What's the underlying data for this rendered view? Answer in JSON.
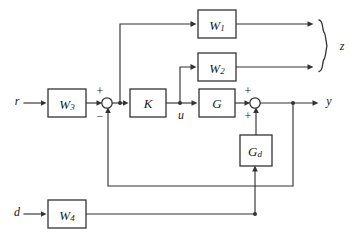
{
  "diagram": {
    "background_color": "#ffffff",
    "line_color": "#333333",
    "text_color": "#1a1a1a"
  },
  "blocks": {
    "w1": {
      "label": "W",
      "subscript": "1",
      "x": 198,
      "y": 10,
      "w": 38,
      "h": 28
    },
    "w2": {
      "label": "W",
      "subscript": "2",
      "x": 198,
      "y": 53,
      "w": 38,
      "h": 28
    },
    "w3": {
      "label": "W",
      "subscript": "3",
      "x": 48,
      "y": 89,
      "w": 38,
      "h": 28
    },
    "w4": {
      "label": "W",
      "subscript": "4",
      "x": 48,
      "y": 200,
      "w": 38,
      "h": 28
    },
    "k": {
      "label": "K",
      "subscript": "",
      "x": 130,
      "y": 89,
      "w": 36,
      "h": 28
    },
    "g": {
      "label": "G",
      "subscript": "",
      "x": 199,
      "y": 89,
      "w": 36,
      "h": 28
    },
    "gd": {
      "label": "G",
      "subscript": "d",
      "x": 240,
      "y": 135,
      "w": 32,
      "h": 31
    }
  },
  "signals": {
    "r": {
      "label": "r",
      "x": 17,
      "y": 101
    },
    "d": {
      "label": "d",
      "x": 17,
      "y": 212
    },
    "u": {
      "label": "u",
      "x": 181,
      "y": 115
    },
    "y": {
      "label": "y",
      "x": 327,
      "y": 101
    },
    "z": {
      "label": "z",
      "x": 341,
      "y": 46
    }
  },
  "summing_junctions": {
    "error_sum": {
      "name": "error-summing-junction",
      "cx": 107,
      "cy": 103,
      "r": 5.2,
      "signs": [
        {
          "symbol": "+",
          "x": 100,
          "y": 91,
          "port": "top-left-reference"
        },
        {
          "symbol": "−",
          "x": 100,
          "y": 116,
          "port": "bottom-feedback"
        }
      ]
    },
    "output_sum": {
      "name": "output-summing-junction",
      "cx": 255,
      "cy": 103,
      "r": 5.2,
      "signs": [
        {
          "symbol": "+",
          "x": 248,
          "y": 91,
          "port": "top-plant-output"
        },
        {
          "symbol": "+",
          "x": 248,
          "y": 116,
          "port": "bottom-disturbance"
        }
      ]
    }
  },
  "brace": {
    "name": "output-grouping-brace",
    "x": 318,
    "top_y": 24,
    "bottom_y": 67,
    "mid_y": 46,
    "depth": 7
  },
  "junction_dots": [
    {
      "name": "error-branch-dot",
      "cx": 120,
      "cy": 103
    },
    {
      "name": "control-branch-dot",
      "cx": 180,
      "cy": 103
    },
    {
      "name": "output-branch-dot",
      "cx": 293,
      "cy": 103
    },
    {
      "name": "disturbance-branch-dot",
      "cx": 255,
      "cy": 212
    }
  ],
  "wires": [
    {
      "name": "wire-r-to-w3",
      "path": "M 24,103 L 44,103",
      "arrow": "right",
      "arrow_at": [
        46,
        103
      ]
    },
    {
      "name": "wire-w3-to-sum",
      "path": "M 86,103 L 100,103",
      "arrow": "right",
      "arrow_at": [
        101.5,
        103
      ]
    },
    {
      "name": "wire-sum-to-k",
      "path": "M 112,103 L 126,103",
      "arrow": "right",
      "arrow_at": [
        128,
        103
      ]
    },
    {
      "name": "wire-error-branch-up",
      "path": "M 120,103 L 120,24 L 192,24",
      "arrow": "right",
      "arrow_at": [
        196,
        24
      ]
    },
    {
      "name": "wire-k-to-g",
      "path": "M 166,103 L 195,103",
      "arrow": "right",
      "arrow_at": [
        197,
        103
      ]
    },
    {
      "name": "wire-control-branch-up",
      "path": "M 180,103 L 180,67 L 192,67",
      "arrow": "right",
      "arrow_at": [
        196,
        67
      ]
    },
    {
      "name": "wire-g-to-sum",
      "path": "M 235,103 L 248,103",
      "arrow": "right",
      "arrow_at": [
        249.5,
        103
      ]
    },
    {
      "name": "wire-sum-to-y",
      "path": "M 261,103 L 314,103",
      "arrow": "right",
      "arrow_at": [
        318,
        103
      ]
    },
    {
      "name": "wire-w1-to-brace",
      "path": "M 236,24 L 309,24",
      "arrow": "right",
      "arrow_at": [
        313,
        24
      ]
    },
    {
      "name": "wire-w2-to-brace",
      "path": "M 236,67 L 309,67",
      "arrow": "right",
      "arrow_at": [
        313,
        67
      ]
    },
    {
      "name": "wire-gd-to-sum",
      "path": "M 256,135 L 256,110",
      "arrow": "up",
      "arrow_at": [
        256,
        107
      ]
    },
    {
      "name": "wire-output-feedback",
      "path": "M 293,103 L 293,186 L 108,186 L 108,110",
      "arrow": "up",
      "arrow_at": [
        108,
        107
      ]
    },
    {
      "name": "wire-d-to-w4",
      "path": "M 24,214 L 44,214",
      "arrow": "right",
      "arrow_at": [
        46,
        214
      ]
    },
    {
      "name": "wire-w4-to-gd",
      "path": "M 86,214 L 255,214 L 255,170",
      "arrow": "up",
      "arrow_at": [
        255,
        166
      ]
    }
  ],
  "semantics": {
    "description": "Two-degree-of-freedom weighted control loop. Reference r passes through weight W3 into a summing junction where the measured output y is subtracted. The error drives controller K and is also weighted by W1 as a performance output. The control signal u drives plant G and is weighted by W2 as a second performance output. Disturbance d is shaped by W4, filtered by Gd, and added at the plant output to form y. The two weighted outputs are grouped by a brace into the generalized error vector z."
  }
}
